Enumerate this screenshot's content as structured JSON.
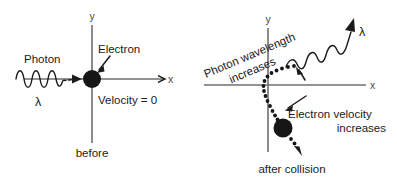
{
  "figure": {
    "background_color": "#ffffff",
    "ink_color": "#1b1b1b",
    "axis_color": "#6f6f6f"
  },
  "left_panel": {
    "caption": "before",
    "axis_y_label": "y",
    "axis_x_label": "x",
    "photon_label": "Photon",
    "wavelength_symbol": "λ",
    "electron_label": "Electron",
    "velocity_label": "Velocity = 0",
    "incoming_wave": {
      "cycles": 3,
      "direction": "left-to-right",
      "amplitude_px": 9,
      "wavelength_px": 15
    },
    "electron": {
      "center_x": 92,
      "center_y": 79,
      "radius": 9,
      "velocity": 0
    }
  },
  "right_panel": {
    "caption": "after collision",
    "axis_y_label": "y",
    "axis_x_label": "x",
    "photon_text_line1": "Photon wavelength",
    "photon_text_line2": "increases",
    "photon_text_rotation_deg": -23,
    "wavelength_symbol": "λ",
    "electron_text_line1": "Electron velocity",
    "electron_text_line2": "increases",
    "scattered_wave": {
      "cycles": 3,
      "direction": "up-and-to-the-right",
      "amplitude_px": 10,
      "wavelength_px": 22,
      "note": "longer wavelength than incoming photon"
    },
    "electron": {
      "center_x": 283,
      "center_y": 128,
      "radius": 9,
      "path_style": "dotted",
      "direction": "down-and-to-the-right"
    }
  }
}
